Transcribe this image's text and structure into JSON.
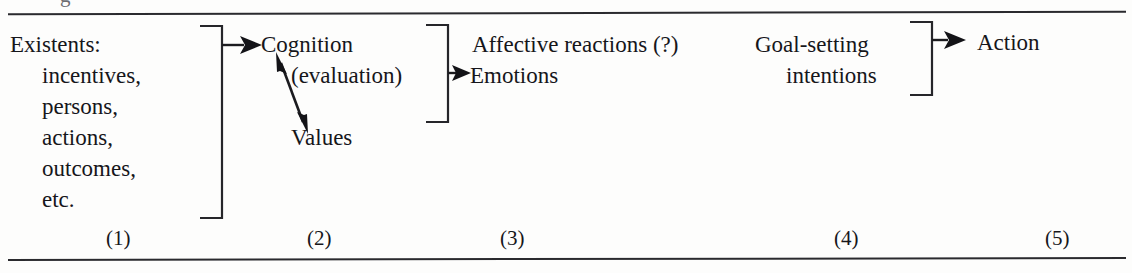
{
  "figure": {
    "caption_fragment": "g",
    "columns": [
      {
        "number": "(1)",
        "lines": [
          "Existents:",
          "incentives,",
          "persons,",
          "actions,",
          "outcomes,",
          "etc."
        ]
      },
      {
        "number": "(2)",
        "lines": [
          "Cognition",
          "(evaluation)",
          "Values"
        ]
      },
      {
        "number": "(3)",
        "lines": [
          "Affective reactions (?)",
          "Emotions"
        ]
      },
      {
        "number": "(4)",
        "lines": [
          "Goal-setting",
          "intentions"
        ]
      },
      {
        "number": "(5)",
        "lines": [
          "Action"
        ]
      }
    ],
    "text": {
      "existents_heading": "Existents:",
      "existents_item_1": "incentives,",
      "existents_item_2": "persons,",
      "existents_item_3": "actions,",
      "existents_item_4": "outcomes,",
      "existents_item_5": "etc.",
      "cognition": "Cognition",
      "evaluation": "(evaluation)",
      "values": "Values",
      "affective_reactions": "Affective reactions (?)",
      "emotions": "Emotions",
      "goal_setting": "Goal-setting",
      "intentions": "intentions",
      "action": "Action"
    },
    "numbers": {
      "n1": "(1)",
      "n2": "(2)",
      "n3": "(3)",
      "n4": "(4)",
      "n5": "(5)"
    },
    "colors": {
      "ink": "#16161a",
      "rule": "#2a2a2e",
      "paper": "#fdfdfc"
    }
  }
}
